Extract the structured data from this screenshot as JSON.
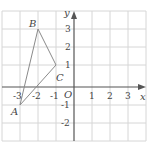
{
  "diagram": {
    "type": "coordinate-plane",
    "axes": {
      "x_label": "x",
      "y_label": "y",
      "origin_label": "O"
    },
    "x_ticks": [
      "-3",
      "-2",
      "-1",
      "1",
      "2",
      "3"
    ],
    "y_ticks": [
      "3",
      "2",
      "1",
      "-1",
      "-2"
    ],
    "x_range": [
      -4,
      4
    ],
    "y_range": [
      -3,
      4
    ],
    "points": [
      {
        "label": "A",
        "x": -3,
        "y": -1
      },
      {
        "label": "B",
        "x": -2,
        "y": 3
      },
      {
        "label": "C",
        "x": -1,
        "y": 1
      }
    ],
    "shape": "triangle ABC"
  }
}
